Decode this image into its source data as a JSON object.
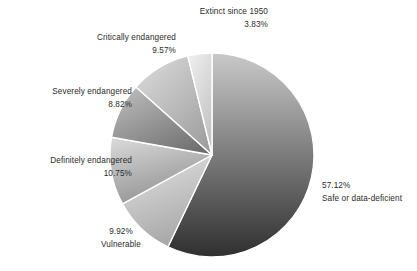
{
  "chart_data": {
    "type": "pie",
    "title": "",
    "subtitle": "",
    "xlabel": "",
    "ylabel": "",
    "legend_position": "none",
    "grid": false,
    "start_angle_deg": 0,
    "direction": "clockwise",
    "units": "percent",
    "categories": [
      "Safe or data-deficient",
      "Vulnerable",
      "Definitely endangered",
      "Severely endangered",
      "Critically endangered",
      "Extinct since 1950"
    ],
    "values": [
      57.12,
      9.92,
      10.75,
      8.82,
      9.57,
      3.83
    ],
    "slices": [
      {
        "name": "Safe or data-deficient",
        "value": 57.12,
        "value_label": "57.12%",
        "color_top": "#c9c9c9",
        "color_bottom": "#2f2f2f",
        "start_deg": 0,
        "end_deg": 205.632
      },
      {
        "name": "Vulnerable",
        "value": 9.92,
        "value_label": "9.92%",
        "color_top": "#e4e4e4",
        "color_bottom": "#a9a9a9",
        "start_deg": 205.632,
        "end_deg": 241.344
      },
      {
        "name": "Definitely endangered",
        "value": 10.75,
        "value_label": "10.75%",
        "color_top": "#d6d6d6",
        "color_bottom": "#8f8f8f",
        "start_deg": 241.344,
        "end_deg": 280.044
      },
      {
        "name": "Severely endangered",
        "value": 8.82,
        "value_label": "8.82%",
        "color_top": "#bdbdbd",
        "color_bottom": "#6e6e6e",
        "start_deg": 280.044,
        "end_deg": 311.796
      },
      {
        "name": "Critically endangered",
        "value": 9.57,
        "value_label": "9.57%",
        "color_top": "#dadada",
        "color_bottom": "#9c9c9c",
        "start_deg": 311.796,
        "end_deg": 346.248
      },
      {
        "name": "Extinct since 1950",
        "value": 3.83,
        "value_label": "3.83%",
        "color_top": "#f0f0f0",
        "color_bottom": "#c4c4c4",
        "start_deg": 346.248,
        "end_deg": 360
      }
    ],
    "geometry": {
      "center_x": 212,
      "center_y": 155,
      "radius": 102,
      "separator_color": "#ffffff",
      "background": "#ffffff"
    }
  },
  "labels": {
    "extinct": {
      "name": "Extinct since 1950",
      "pct": "3.83%"
    },
    "critically": {
      "name": "Critically endangered",
      "pct": "9.57%"
    },
    "severely": {
      "name": "Severely endangered",
      "pct": "8.82%"
    },
    "definitely": {
      "name": "Definitely endangered",
      "pct": "10.75%"
    },
    "vulnerable": {
      "name": "Vulnerable",
      "pct": "9.92%"
    },
    "safe": {
      "name": "Safe or data-deficient",
      "pct": "57.12%"
    }
  }
}
